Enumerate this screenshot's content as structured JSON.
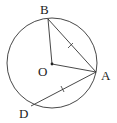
{
  "diagram": {
    "type": "geometry-circle",
    "circle": {
      "center": "O",
      "cx": 52,
      "cy": 63,
      "r": 45
    },
    "points": {
      "B": {
        "label": "B",
        "x": 48,
        "y": 19
      },
      "O": {
        "label": "O",
        "x": 52,
        "y": 64
      },
      "A": {
        "label": "A",
        "x": 96,
        "y": 72
      },
      "D": {
        "label": "D",
        "x": 31,
        "y": 106
      }
    },
    "segments": [
      {
        "from": "B",
        "to": "O"
      },
      {
        "from": "O",
        "to": "A"
      },
      {
        "from": "B",
        "to": "A",
        "tick": true
      },
      {
        "from": "A",
        "to": "D",
        "tick": true
      }
    ],
    "line_color": "#333333"
  }
}
